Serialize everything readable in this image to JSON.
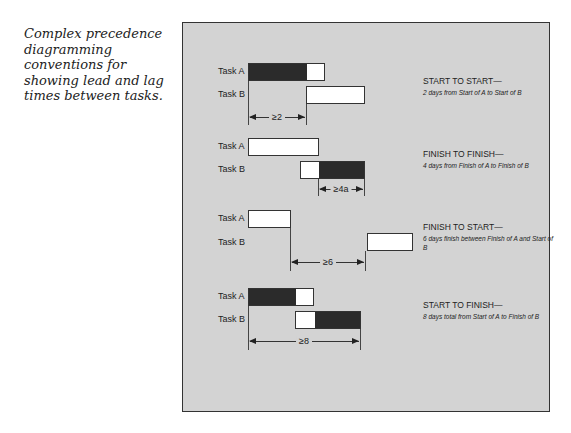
{
  "caption": "Complex precedence diagramming conventions for showing lead and lag times between tasks.",
  "task_a_label": "Task A",
  "task_b_label": "Task B",
  "relationships": [
    {
      "title": "START TO START—",
      "description": "2 days from Start of A to Start of B",
      "lag": "≥2"
    },
    {
      "title": "FINISH TO FINISH—",
      "description": "4 days from Finish of A to Finish of B",
      "lag": "≥4a"
    },
    {
      "title": "FINISH TO START—",
      "description": "6 days finish between Finish of A and Start of B",
      "lag": "≥6"
    },
    {
      "title": "START TO FINISH—",
      "description": "8 days total from Start of A to Finish of B",
      "lag": "≥8"
    }
  ]
}
